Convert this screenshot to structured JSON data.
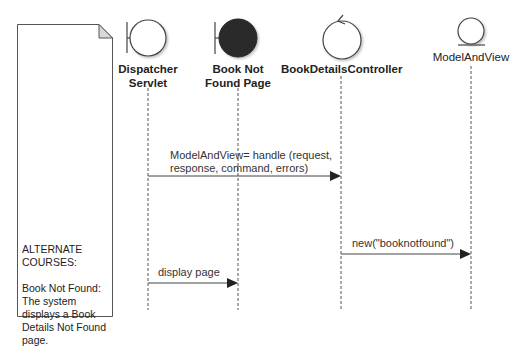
{
  "note": {
    "heading": "ALTERNATE COURSES:",
    "body": "Book Not Found: The system displays a Book Details Not Found page."
  },
  "lifelines": [
    {
      "id": "dispatcher",
      "label_line1": "Dispatcher",
      "label_line2": "Servlet",
      "stereotype": "boundary",
      "filled": false,
      "bold": true
    },
    {
      "id": "notfound",
      "label_line1": "Book Not",
      "label_line2": "Found Page",
      "stereotype": "boundary",
      "filled": true,
      "bold": true
    },
    {
      "id": "controller",
      "label_line1": "BookDetailsController",
      "stereotype": "control",
      "filled": false,
      "bold": true
    },
    {
      "id": "modelandview",
      "label_line1": "ModelAndView",
      "stereotype": "entity",
      "filled": false,
      "bold": false
    }
  ],
  "messages": [
    {
      "from": "dispatcher",
      "to": "controller",
      "line1": "ModelAndView= handle (request,",
      "line2": "response, command, errors)"
    },
    {
      "from": "controller",
      "to": "modelandview",
      "line1": "new(\"booknotfound\")"
    },
    {
      "from": "dispatcher",
      "to": "notfound",
      "line1": "display page"
    }
  ],
  "colors": {
    "line": "#444444",
    "filled_boundary": "#2a2a2a",
    "note_fold": "#d8d8d8"
  }
}
